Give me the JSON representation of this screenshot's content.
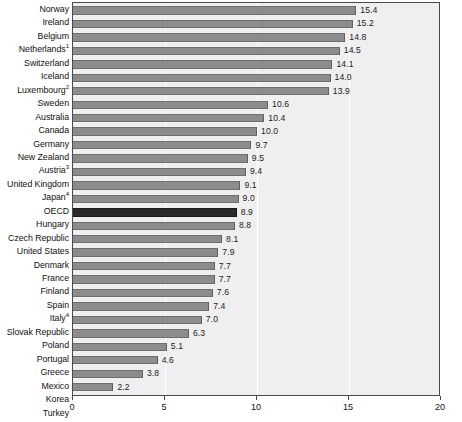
{
  "chart_data": {
    "type": "bar",
    "orientation": "horizontal",
    "title": "",
    "xlabel": "",
    "ylabel": "",
    "xlim": [
      0,
      20
    ],
    "xticks": [
      0,
      5,
      10,
      15,
      20
    ],
    "xtick_labels": [
      "0",
      "5",
      "10",
      "15",
      "20"
    ],
    "grid": true,
    "legend": "none",
    "highlight_category": "OECD",
    "categories": [
      "Norway",
      "Ireland",
      "Belgium",
      "Netherlands",
      "Switzerland",
      "Iceland",
      "Luxembourg",
      "Sweden",
      "Australia",
      "Canada",
      "Germany",
      "New Zealand",
      "Austria",
      "United Kingdom",
      "Japan",
      "OECD",
      "Hungary",
      "Czech Republic",
      "United States",
      "Denmark",
      "France",
      "Finland",
      "Spain",
      "Italy",
      "Slovak Republic",
      "Poland",
      "Portugal",
      "Greece",
      "Mexico",
      "Korea",
      "Turkey"
    ],
    "footnotes": {
      "Netherlands": "1",
      "Luxembourg": "2",
      "Austria": "3",
      "Japan": "4",
      "Italy": "4"
    },
    "values": [
      15.4,
      15.2,
      14.8,
      14.5,
      14.1,
      14.0,
      13.9,
      10.6,
      10.4,
      10.0,
      9.7,
      9.5,
      9.4,
      9.1,
      9.0,
      8.9,
      8.8,
      8.1,
      7.9,
      7.7,
      7.7,
      7.6,
      7.4,
      7.0,
      6.3,
      5.1,
      4.6,
      3.8,
      2.2,
      1.9,
      1.8
    ],
    "value_labels": [
      "15.4",
      "15.2",
      "14.8",
      "14.5",
      "14.1",
      "14.0",
      "13.9",
      "10.6",
      "10.4",
      "10.0",
      "9.7",
      "9.5",
      "9.4",
      "9.1",
      "9.0",
      "8.9",
      "8.8",
      "8.1",
      "7.9",
      "7.7",
      "7.7",
      "7.6",
      "7.4",
      "7.0",
      "6.3",
      "5.1",
      "4.6",
      "3.8",
      "2.2",
      "1.9",
      "1.8"
    ],
    "colors": {
      "bar": "#8c8c8c",
      "bar_highlight": "#2b2b2b",
      "plot_background": "#efefef",
      "frame": "#4a4a4a",
      "gridline": "#ffffff",
      "text": "#111111"
    }
  }
}
